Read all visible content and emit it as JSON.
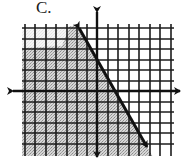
{
  "figure": {
    "label": "C."
  },
  "grid": {
    "vertical_lines_x": [
      25,
      35,
      46,
      56,
      67,
      77,
      87,
      108,
      118,
      129,
      139,
      150,
      160,
      171
    ],
    "horizontal_lines_y": [
      28,
      39,
      49,
      60,
      70,
      81,
      102,
      112,
      123,
      133,
      144
    ],
    "x_min": 22,
    "x_max": 174,
    "y_min": 24,
    "y_max": 156,
    "line_color": "#1c1c1c"
  },
  "axes": {
    "x_axis": {
      "y": 91,
      "x_start": 10,
      "x_end": 183
    },
    "y_axis": {
      "x": 97,
      "y_start": 9,
      "y_end": 160
    },
    "color": "#111111"
  },
  "boundary_line": {
    "style": "solid",
    "x1": 77,
    "y1": 25,
    "x2": 149,
    "y2": 150,
    "arrows": "both",
    "approx_slope": -2,
    "color": "#111111"
  },
  "shading": {
    "side": "left/below line",
    "color": "#bdbdbd",
    "pattern": "stippled"
  }
}
